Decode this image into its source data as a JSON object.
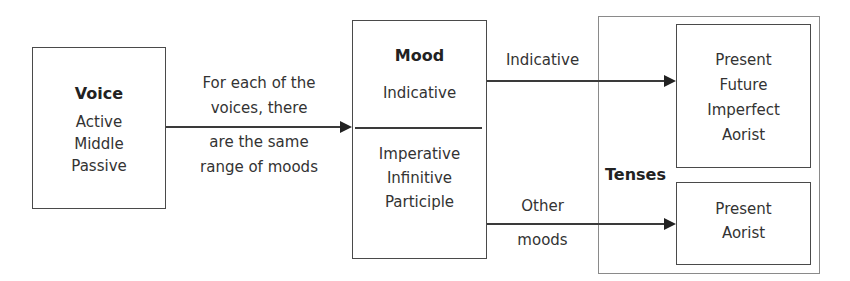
{
  "voice_box": {
    "title": "Voice",
    "items": [
      "Active",
      "Middle",
      "Passive"
    ]
  },
  "voice_to_mood_label": {
    "above": [
      "For each of the",
      "voices, there"
    ],
    "below": [
      "are the same",
      "range of moods"
    ]
  },
  "mood_box": {
    "title": "Mood",
    "top_section": [
      "Indicative"
    ],
    "bottom_section": [
      "Imperative",
      "Infinitive",
      "Participle"
    ]
  },
  "indicative_arrow_label": "Indicative",
  "other_arrow_label": {
    "above": "Other",
    "below": "moods"
  },
  "tenses_group": {
    "label": "Tenses",
    "indicative_tenses": [
      "Present",
      "Future",
      "Imperfect",
      "Aorist"
    ],
    "other_tenses": [
      "Present",
      "Aorist"
    ]
  },
  "colors": {
    "line": "#3a3a3a",
    "box_border": "#4a4a4a",
    "outer_border": "#8a8a8a",
    "text": "#333333"
  }
}
